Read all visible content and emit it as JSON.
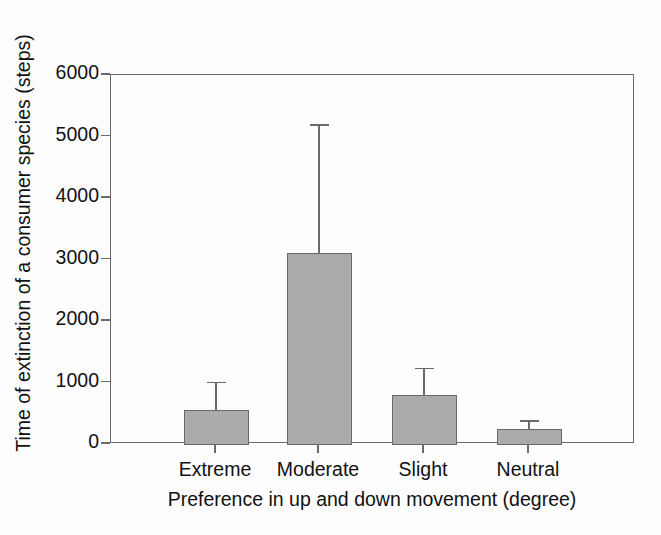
{
  "chart_data": {
    "type": "bar",
    "title": "",
    "subtitle": "",
    "xlabel": "Preference in up and down movement (degree)",
    "ylabel": "Time of extinction of a consumer species (steps)",
    "categories": [
      "Extreme",
      "Moderate",
      "Slight",
      "Neutral"
    ],
    "values": [
      550,
      3100,
      800,
      250
    ],
    "errors_upper": [
      460,
      2100,
      440,
      140
    ],
    "errors_lower": [
      0,
      0,
      0,
      0
    ],
    "error_type": "upper-only",
    "ylim": [
      0,
      6000
    ],
    "yticks": [
      0,
      1000,
      2000,
      3000,
      4000,
      5000,
      6000
    ],
    "ytick_labels": [
      "0",
      "1000",
      "2000",
      "3000",
      "4000",
      "5000",
      "6000"
    ],
    "grid": false,
    "legend": false,
    "legend_position": "none",
    "bar_color": "#ababab",
    "bar_edge_color": "#6a6a6a",
    "axis_color": "#6b6b6b",
    "background_color": "#fdfdfd",
    "series": [
      {
        "name": "Time of extinction",
        "values": [
          550,
          3100,
          800,
          250
        ],
        "errors_upper": [
          460,
          2100,
          440,
          140
        ]
      }
    ],
    "points": [
      {
        "category": "Extreme",
        "value": 550,
        "error_top": 1010
      },
      {
        "category": "Moderate",
        "value": 3100,
        "error_top": 5200
      },
      {
        "category": "Slight",
        "value": 800,
        "error_top": 1240
      },
      {
        "category": "Neutral",
        "value": 250,
        "error_top": 390
      }
    ]
  },
  "axes": {
    "y_tick_0": "0",
    "y_tick_1": "1000",
    "y_tick_2": "2000",
    "y_tick_3": "3000",
    "y_tick_4": "4000",
    "y_tick_5": "5000",
    "y_tick_6": "6000"
  }
}
